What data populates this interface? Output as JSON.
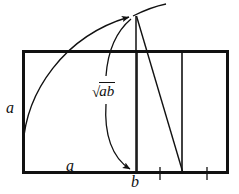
{
  "figure": {
    "canvas": {
      "width": 239,
      "height": 194,
      "background": "#ffffff"
    },
    "stroke_color": "#111111",
    "labels": {
      "side_a_left": "a",
      "side_a_bottom": "a",
      "segment_b": "b",
      "geometric_mean_radical": "√",
      "geometric_mean_radicand": "ab"
    },
    "geometry": {
      "rectangle": {
        "x1": 22,
        "y1": 50,
        "x2": 228,
        "y2": 174,
        "stroke_width": 3
      },
      "vertical_divider_1_x": 137,
      "vertical_divider_2_x": 182,
      "apex_point": {
        "x": 136,
        "y": 14
      },
      "arc_start": {
        "x": 23,
        "y": 145
      },
      "tick_marks_x": [
        160,
        207
      ],
      "diagonal_end": {
        "x": 183,
        "y": 173
      },
      "scurve_arrow_end": {
        "x": 133,
        "y": 171
      }
    }
  }
}
